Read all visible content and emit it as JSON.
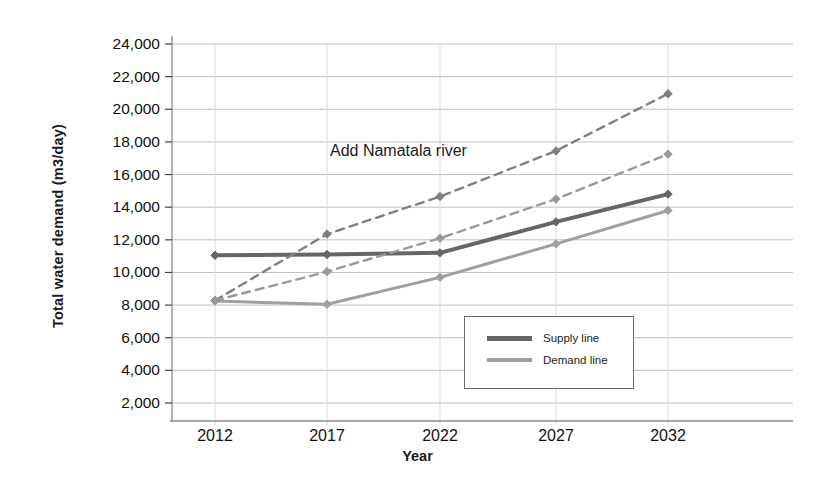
{
  "chart_data": {
    "type": "line",
    "title": "",
    "xlabel": "Year",
    "ylabel": "Total water demand (m3/day)",
    "categories": [
      "2012",
      "2017",
      "2022",
      "2027",
      "2032"
    ],
    "x": [
      2012,
      2017,
      2022,
      2027,
      2032
    ],
    "xlim": [
      2010,
      2034
    ],
    "ylim": [
      2000,
      24000
    ],
    "ytick_labels": [
      "24,000",
      "22,000",
      "20,000",
      "18,000",
      "16,000",
      "14,000",
      "12,000",
      "10,000",
      "8,000",
      "6,000",
      "4,000",
      "2,000"
    ],
    "ytick_values": [
      24000,
      22000,
      20000,
      18000,
      16000,
      14000,
      12000,
      10000,
      8000,
      6000,
      4000,
      2000
    ],
    "grid": "horizontal-and-vertical",
    "legend_position": "inside-center-bottom",
    "annotations": [
      {
        "text": "Add Namatala river",
        "x": 2021,
        "y": 17200
      }
    ],
    "series": [
      {
        "name": "Supply line",
        "style": "solid",
        "color": "#666666",
        "width": 4,
        "marker": "diamond",
        "values": [
          11050,
          11100,
          11200,
          13100,
          14800
        ]
      },
      {
        "name": "Demand line",
        "style": "solid",
        "color": "#a0a0a0",
        "width": 3,
        "marker": "diamond",
        "values": [
          8250,
          8050,
          9700,
          11750,
          13800
        ]
      },
      {
        "name": "Projected supply (upper, dashed)",
        "style": "dashed",
        "color": "#808080",
        "width": 2.4,
        "marker": "diamond",
        "values": [
          8280,
          12350,
          14650,
          17450,
          20950
        ]
      },
      {
        "name": "Projected demand (lower, dashed)",
        "style": "dashed",
        "color": "#9a9a9a",
        "width": 2.4,
        "marker": "diamond",
        "values": [
          8280,
          10050,
          12100,
          14500,
          17250
        ]
      }
    ]
  },
  "legend": {
    "items": [
      {
        "label": "Supply line"
      },
      {
        "label": "Demand line"
      }
    ]
  },
  "axes": {
    "y_title": "Total water demand (m3/day)",
    "x_title": "Year"
  },
  "colors": {
    "supply": "#666666",
    "demand": "#a0a0a0",
    "grid": "#bfbfbf",
    "axis": "#8a8a8a",
    "text": "#1a1a1a",
    "background": "#ffffff"
  }
}
